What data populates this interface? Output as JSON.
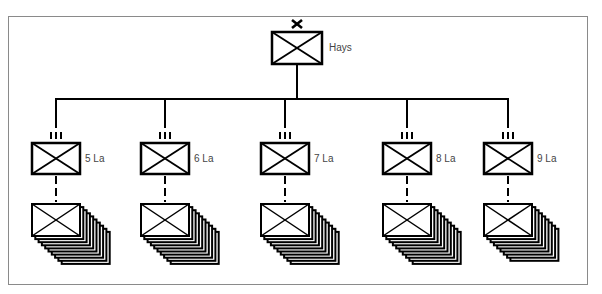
{
  "diagram": {
    "type": "org-chart",
    "headquarters": {
      "label": "Hays",
      "symbol": "infantry-box",
      "echelon_marker": "X",
      "center_x": 297
    },
    "units": [
      {
        "label": "5 La",
        "echelon_marker": "III",
        "center_x": 56,
        "stack_layers": 9
      },
      {
        "label": "6 La",
        "echelon_marker": "III",
        "center_x": 165,
        "stack_layers": 9
      },
      {
        "label": "7 La",
        "echelon_marker": "III",
        "center_x": 285,
        "stack_layers": 9
      },
      {
        "label": "8 La",
        "echelon_marker": "III",
        "center_x": 407,
        "stack_layers": 9
      },
      {
        "label": "9 La",
        "echelon_marker": "III",
        "center_x": 508,
        "stack_layers": 8
      }
    ],
    "colors": {
      "line": "#000000",
      "frame": "#8a8a8a",
      "label": "#444444"
    }
  }
}
